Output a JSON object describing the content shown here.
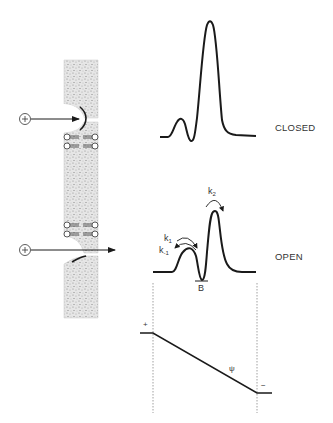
{
  "states": {
    "closed": {
      "label": "CLOSED"
    },
    "open": {
      "label": "OPEN"
    }
  },
  "rate_constants": {
    "k1": {
      "base": "k",
      "sub": "1"
    },
    "k_minus1": {
      "base": "k",
      "sub": "-1"
    },
    "k2": {
      "base": "k",
      "sub": "2"
    }
  },
  "binding_site": {
    "label": "B"
  },
  "potential": {
    "symbol": "ψ",
    "plus_sign": "+",
    "minus_sign": "−"
  },
  "ions": [
    {
      "charge": "+",
      "state": "closed"
    },
    {
      "charge": "+",
      "state": "open"
    }
  ],
  "colors": {
    "line": "#1a1a1a",
    "membrane": "#d9d9d9",
    "text": "#333333"
  }
}
